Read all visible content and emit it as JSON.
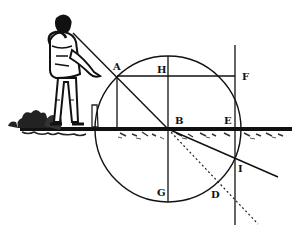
{
  "diagram": {
    "colors": {
      "ink": "#111111",
      "background": "#ffffff"
    },
    "points": {
      "A": {
        "label": "A",
        "x": 117,
        "y": 76
      },
      "H": {
        "label": "H",
        "x": 168,
        "y": 76
      },
      "F": {
        "label": "F",
        "x": 235,
        "y": 76
      },
      "B": {
        "label": "B",
        "x": 168,
        "y": 129
      },
      "E": {
        "label": "E",
        "x": 235,
        "y": 129
      },
      "I": {
        "label": "I",
        "x": 235,
        "y": 158
      },
      "G": {
        "label": "G",
        "x": 168,
        "y": 202
      },
      "D": {
        "label": "D",
        "x": 216,
        "y": 186
      }
    },
    "circle": {
      "center": "B",
      "radius": 73
    },
    "lines": [
      "incident ray from observer through A to B",
      "dotted continuation from B through D",
      "refracted ray from B through I",
      "vertical diameter H-B-G",
      "chord A-H-F",
      "perpendicular from A to surface",
      "vertical line through F, E, I",
      "surface line through B and E"
    ]
  }
}
